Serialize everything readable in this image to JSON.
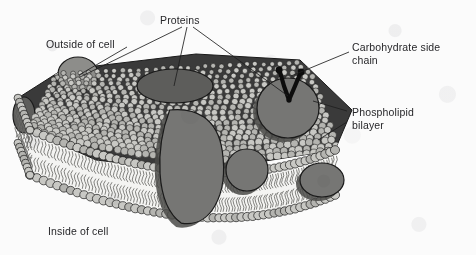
{
  "diagram": {
    "type": "biology-labelled-diagram",
    "canvas": {
      "width": 476,
      "height": 255
    },
    "background_color": "#fbfbfb",
    "texture": "mottled paper grain"
  },
  "labels": [
    {
      "id": "outside-of-cell",
      "text": "Outside of cell",
      "x": 46,
      "y": 38,
      "align": "left"
    },
    {
      "id": "proteins",
      "text": "Proteins",
      "x": 160,
      "y": 14,
      "align": "left"
    },
    {
      "id": "carbohydrate-side-chain",
      "text": "Carbohydrate side\nchain",
      "x": 352,
      "y": 41,
      "align": "left"
    },
    {
      "id": "phospholipid-bilayer",
      "text": "Phospholipid\nbilayer",
      "x": 352,
      "y": 106,
      "align": "left"
    },
    {
      "id": "inside-of-cell",
      "text": "Inside of cell",
      "x": 48,
      "y": 225,
      "align": "left"
    }
  ],
  "leader_lines": [
    {
      "id": "leader-outside-of-cell",
      "from": [
        127,
        47
      ],
      "to": [
        79,
        75
      ],
      "label": "outside-of-cell"
    },
    {
      "id": "leader-proteins-left",
      "from": [
        182,
        27
      ],
      "to": [
        80,
        77
      ],
      "label": "proteins"
    },
    {
      "id": "leader-proteins-middle",
      "from": [
        187,
        27
      ],
      "to": [
        174,
        86
      ],
      "label": "proteins"
    },
    {
      "id": "leader-proteins-right",
      "from": [
        193,
        27
      ],
      "to": [
        288,
        96
      ],
      "label": "proteins"
    },
    {
      "id": "leader-carbohydrate-side-chain",
      "from": [
        349,
        52
      ],
      "to": [
        291,
        76
      ],
      "label": "carbohydrate-side-chain"
    },
    {
      "id": "leader-phospholipid-upper",
      "from": [
        347,
        111
      ],
      "to": [
        313,
        101
      ],
      "label": "phospholipid-bilayer"
    },
    {
      "id": "leader-phospholipid-lower",
      "from": [
        347,
        122
      ],
      "to": [
        318,
        140
      ],
      "label": "phospholipid-bilayer"
    }
  ],
  "colors": {
    "outline": "#1a1a1a",
    "membrane_interior_dark": "#3a3a3a",
    "phospholipid_head_light": "#c8c8c4",
    "phospholipid_head_mid": "#b4b4b0",
    "protein_light": "#8d8d8a",
    "protein_mid": "#767674",
    "protein_dark": "#5d5d5b",
    "protein_shadow": "#4a4a48",
    "carbohydrate": "#0d0d0d",
    "tail_stroke": "#6b6b68",
    "core_fill": "#f4f4f2",
    "label_text": "#27272a"
  },
  "structures": {
    "top_surface": {
      "name": "outer-phospholipid-head-field",
      "description": "dense mosaic of phospholipid head groups viewed from above, perspective quadrilateral",
      "polygon": [
        [
          18,
          98
        ],
        [
          62,
          70
        ],
        [
          196,
          54
        ],
        [
          300,
          60
        ],
        [
          352,
          110
        ],
        [
          335,
          150
        ],
        [
          196,
          172
        ],
        [
          96,
          160
        ],
        [
          30,
          130
        ]
      ],
      "head_count": 760,
      "head_radius": 3.1
    },
    "front_cross_section": {
      "name": "front-cut-face-bilayer",
      "description": "cut face showing two rows of heads with inward-facing fatty-acid tails",
      "outer_row_path": "from (30,130) through (196,172) to (335,150)",
      "inner_row_path": "from (30,175) through (196,216) to (335,194)",
      "head_count_outer": 52,
      "head_count_inner": 52,
      "tail_length": 17,
      "tails_per_head": 2
    },
    "left_cross_section": {
      "name": "left-cut-face-bilayer",
      "description": "narrow left end cut face",
      "outer_row_path": "from (18,98) to (30,130)",
      "inner_row_path": "from (18,143) to (30,175)"
    },
    "proteins": [
      {
        "id": "protein-peripheral-outer-left",
        "label": "peripheral protein on outer surface",
        "shape": "ellipse",
        "cx": 78,
        "cy": 74,
        "rx": 20,
        "ry": 17,
        "shade": "light"
      },
      {
        "id": "protein-integral-surface-mid",
        "label": "integral protein seen from outer surface",
        "shape": "ellipse",
        "cx": 175,
        "cy": 86,
        "rx": 38,
        "ry": 17,
        "shade": "dark"
      },
      {
        "id": "protein-transmembrane-large",
        "label": "large transmembrane protein",
        "shape": "pear",
        "cx": 192,
        "cy": 168,
        "rx": 36,
        "ry": 58,
        "shade": "mid"
      },
      {
        "id": "protein-transmembrane-right",
        "label": "transmembrane globular protein (right)",
        "shape": "ellipse",
        "cx": 288,
        "cy": 108,
        "rx": 31,
        "ry": 30,
        "shade": "mid"
      },
      {
        "id": "protein-peripheral-inner-mid",
        "label": "peripheral protein on inner surface",
        "shape": "ellipse",
        "cx": 247,
        "cy": 170,
        "rx": 21,
        "ry": 21,
        "shade": "mid"
      },
      {
        "id": "protein-peripheral-inner-right",
        "label": "peripheral protein on inner surface (right)",
        "shape": "ellipse",
        "cx": 322,
        "cy": 180,
        "rx": 22,
        "ry": 17,
        "shade": "mid"
      },
      {
        "id": "protein-edge-left",
        "label": "protein at left cut edge",
        "shape": "ellipse",
        "cx": 24,
        "cy": 115,
        "rx": 11,
        "ry": 18,
        "shade": "dark"
      }
    ],
    "carbohydrate_side_chain": {
      "id": "carbohydrate-side-chain-glyph",
      "description": "branched Y-shaped oligosaccharide chain projecting from outer surface",
      "anchor": [
        289,
        100
      ],
      "branches": [
        {
          "points": [
            [
              289,
              100
            ],
            [
              284,
              86
            ],
            [
              280,
              72
            ]
          ],
          "knob": [
            279,
            70
          ]
        },
        {
          "points": [
            [
              289,
              100
            ],
            [
              295,
              86
            ],
            [
              300,
              74
            ]
          ],
          "knob": [
            301,
            72
          ]
        }
      ],
      "stroke_width": 4.2,
      "knob_radius": 3.4
    }
  }
}
